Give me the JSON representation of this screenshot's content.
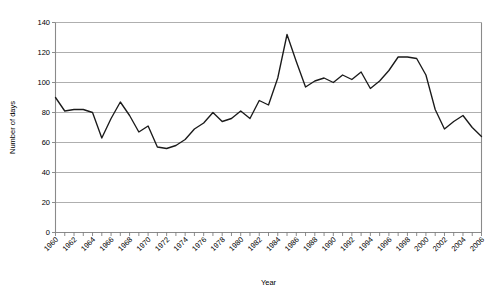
{
  "chart_data": {
    "type": "line",
    "title": "",
    "xlabel": "Year",
    "ylabel": "Number of days",
    "xlim": [
      1960,
      2006
    ],
    "ylim": [
      0,
      140
    ],
    "ytick_step": 20,
    "xtick_step": 1,
    "xtick_label_step": 2,
    "grid": "horizontal",
    "legend": "none",
    "line_color": "#1a1a1a",
    "grid_color": "#9a9a9a",
    "yticks": [
      0,
      20,
      40,
      60,
      80,
      100,
      120,
      140
    ],
    "ytick_labels": [
      "0",
      "20",
      "40",
      "60",
      "80",
      "100",
      "120",
      "140"
    ],
    "xtick_labels": [
      "1960",
      "1962",
      "1964",
      "1966",
      "1968",
      "1970",
      "1972",
      "1974",
      "1976",
      "1978",
      "1980",
      "1982",
      "1984",
      "1986",
      "1988",
      "1990",
      "1992",
      "1994",
      "1996",
      "1998",
      "2000",
      "2002",
      "2004",
      "2006"
    ],
    "x": [
      1960,
      1961,
      1962,
      1963,
      1964,
      1965,
      1966,
      1967,
      1968,
      1969,
      1970,
      1971,
      1972,
      1973,
      1974,
      1975,
      1976,
      1977,
      1978,
      1979,
      1980,
      1981,
      1982,
      1983,
      1984,
      1985,
      1986,
      1987,
      1988,
      1989,
      1990,
      1991,
      1992,
      1993,
      1994,
      1995,
      1996,
      1997,
      1998,
      1999,
      2000,
      2001,
      2002,
      2003,
      2004,
      2005,
      2006
    ],
    "series": [
      {
        "name": "Number of days",
        "values": [
          90,
          81,
          82,
          82,
          80,
          63,
          76,
          87,
          78,
          67,
          71,
          57,
          56,
          58,
          62,
          69,
          73,
          80,
          74,
          76,
          81,
          76,
          88,
          85,
          103,
          132,
          114,
          97,
          101,
          103,
          100,
          105,
          102,
          107,
          96,
          101,
          108,
          117,
          117,
          116,
          105,
          82,
          69,
          74,
          78,
          70,
          64
        ]
      }
    ]
  }
}
